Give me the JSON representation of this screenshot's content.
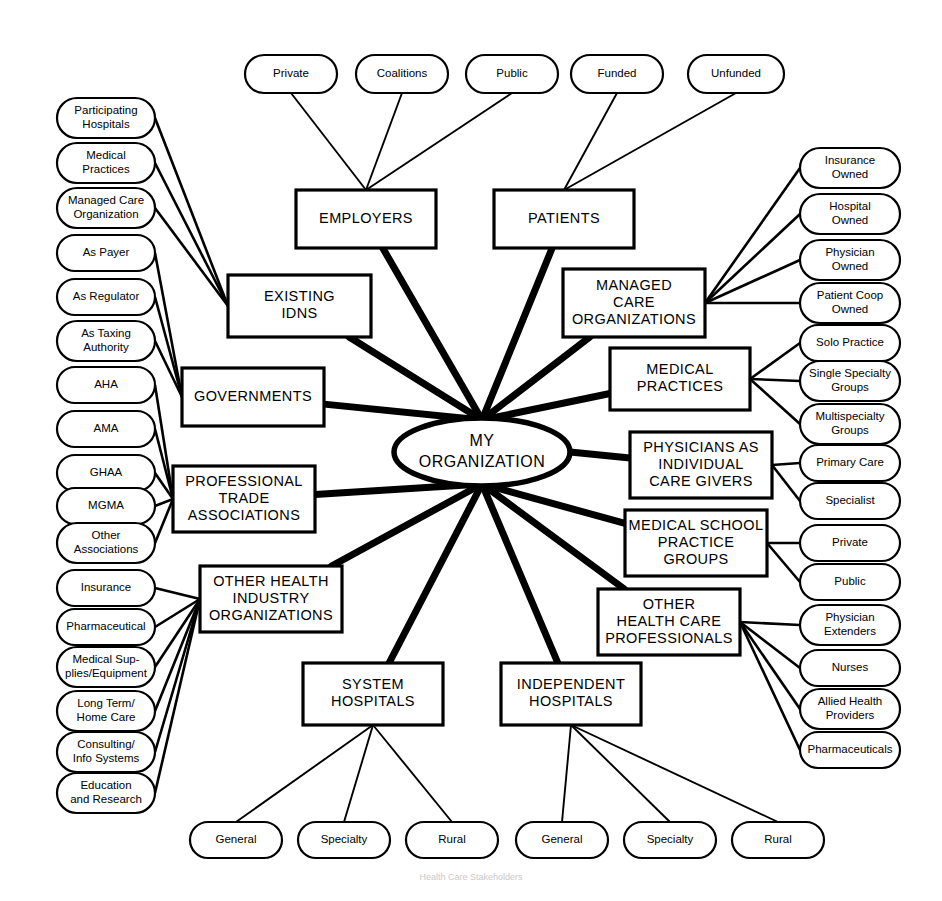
{
  "diagram": {
    "center": {
      "line1": "MY",
      "line2": "ORGANIZATION"
    },
    "colors": {
      "stroke": "#000000",
      "fill": "#ffffff",
      "background": "#ffffff"
    },
    "caption": "Health Care Stakeholders"
  },
  "top_pills": [
    {
      "label": "Private",
      "x": 245,
      "y": 74,
      "w": 92,
      "h": 38
    },
    {
      "label": "Coalitions",
      "x": 356,
      "y": 74,
      "w": 92,
      "h": 38
    },
    {
      "label": "Public",
      "x": 466,
      "y": 74,
      "w": 92,
      "h": 38
    },
    {
      "label": "Funded",
      "x": 571,
      "y": 74,
      "w": 92,
      "h": 38
    },
    {
      "label": "Unfunded",
      "x": 688,
      "y": 74,
      "w": 96,
      "h": 38
    }
  ],
  "left_pills": [
    {
      "lines": [
        "Participating",
        "Hospitals"
      ],
      "cy": 118,
      "target": "existing-idns"
    },
    {
      "lines": [
        "Medical",
        "Practices"
      ],
      "cy": 163,
      "target": "existing-idns"
    },
    {
      "lines": [
        "Managed Care",
        "Organization"
      ],
      "cy": 208,
      "target": "existing-idns"
    },
    {
      "lines": [
        "As Payer"
      ],
      "cy": 253,
      "target": "governments"
    },
    {
      "lines": [
        "As Regulator"
      ],
      "cy": 297,
      "target": "governments"
    },
    {
      "lines": [
        "As Taxing",
        "Authority"
      ],
      "cy": 341,
      "target": "governments"
    },
    {
      "lines": [
        "AHA"
      ],
      "cy": 385,
      "target": "professional-trade"
    },
    {
      "lines": [
        "AMA"
      ],
      "cy": 429,
      "target": "professional-trade"
    },
    {
      "lines": [
        "GHAA"
      ],
      "cy": 473,
      "target": "professional-trade"
    },
    {
      "lines": [
        "MGMA"
      ],
      "cy": 506,
      "target": "professional-trade"
    },
    {
      "lines": [
        "Other",
        "Associations"
      ],
      "cy": 543,
      "target": "professional-trade"
    },
    {
      "lines": [
        "Insurance"
      ],
      "cy": 588,
      "target": "other-health-industry"
    },
    {
      "lines": [
        "Pharmaceutical"
      ],
      "cy": 627,
      "target": "other-health-industry"
    },
    {
      "lines": [
        "Medical Sup-",
        "plies/Equipment"
      ],
      "cy": 667,
      "target": "other-health-industry"
    },
    {
      "lines": [
        "Long Term/",
        "Home Care"
      ],
      "cy": 711,
      "target": "other-health-industry"
    },
    {
      "lines": [
        "Consulting/",
        "Info Systems"
      ],
      "cy": 752,
      "target": "other-health-industry"
    },
    {
      "lines": [
        "Education",
        "and Research"
      ],
      "cy": 793,
      "target": "other-health-industry"
    }
  ],
  "right_pills": [
    {
      "lines": [
        "Insurance",
        "Owned"
      ],
      "cy": 168,
      "target": "managed-care"
    },
    {
      "lines": [
        "Hospital",
        "Owned"
      ],
      "cy": 214,
      "target": "managed-care"
    },
    {
      "lines": [
        "Physician",
        "Owned"
      ],
      "cy": 260,
      "target": "managed-care"
    },
    {
      "lines": [
        "Patient Coop",
        "Owned"
      ],
      "cy": 303,
      "target": "managed-care"
    },
    {
      "lines": [
        "Solo Practice"
      ],
      "cy": 343,
      "target": "medical-practices"
    },
    {
      "lines": [
        "Single Specialty",
        "Groups"
      ],
      "cy": 381,
      "target": "medical-practices"
    },
    {
      "lines": [
        "Multispecialty",
        "Groups"
      ],
      "cy": 424,
      "target": "medical-practices"
    },
    {
      "lines": [
        "Primary Care"
      ],
      "cy": 463,
      "target": "physicians-individual"
    },
    {
      "lines": [
        "Specialist"
      ],
      "cy": 501,
      "target": "physicians-individual"
    },
    {
      "lines": [
        "Private"
      ],
      "cy": 543,
      "target": "medical-school"
    },
    {
      "lines": [
        "Public"
      ],
      "cy": 582,
      "target": "medical-school"
    },
    {
      "lines": [
        "Physician",
        "Extenders"
      ],
      "cy": 625,
      "target": "other-health-care-prof"
    },
    {
      "lines": [
        "Nurses"
      ],
      "cy": 668,
      "target": "other-health-care-prof"
    },
    {
      "lines": [
        "Allied Health",
        "Providers"
      ],
      "cy": 709,
      "target": "other-health-care-prof"
    },
    {
      "lines": [
        "Pharmaceuticals"
      ],
      "cy": 750,
      "target": "other-health-care-prof"
    }
  ],
  "bottom_pills": [
    {
      "label": "General",
      "x": 190,
      "y": 840,
      "w": 92,
      "h": 36,
      "target": "system-hospitals"
    },
    {
      "label": "Specialty",
      "x": 298,
      "y": 840,
      "w": 92,
      "h": 36,
      "target": "system-hospitals"
    },
    {
      "label": "Rural",
      "x": 406,
      "y": 840,
      "w": 92,
      "h": 36,
      "target": "system-hospitals"
    },
    {
      "label": "General",
      "x": 516,
      "y": 840,
      "w": 92,
      "h": 36,
      "target": "independent-hospitals"
    },
    {
      "label": "Specialty",
      "x": 624,
      "y": 840,
      "w": 92,
      "h": 36,
      "target": "independent-hospitals"
    },
    {
      "label": "Rural",
      "x": 732,
      "y": 840,
      "w": 92,
      "h": 36,
      "target": "independent-hospitals"
    }
  ],
  "boxes": [
    {
      "id": "employers",
      "lines": [
        "EMPLOYERS"
      ],
      "x": 296,
      "y": 190,
      "w": 140,
      "h": 58
    },
    {
      "id": "patients",
      "lines": [
        "PATIENTS"
      ],
      "x": 494,
      "y": 190,
      "w": 140,
      "h": 58
    },
    {
      "id": "existing-idns",
      "lines": [
        "EXISTING",
        "IDNS"
      ],
      "x": 228,
      "y": 275,
      "w": 143,
      "h": 62
    },
    {
      "id": "managed-care",
      "lines": [
        "MANAGED",
        "CARE",
        "ORGANIZATIONS"
      ],
      "x": 563,
      "y": 269,
      "w": 142,
      "h": 68
    },
    {
      "id": "governments",
      "lines": [
        "GOVERNMENTS"
      ],
      "x": 182,
      "y": 368,
      "w": 142,
      "h": 58
    },
    {
      "id": "medical-practices",
      "lines": [
        "MEDICAL",
        "PRACTICES"
      ],
      "x": 610,
      "y": 348,
      "w": 140,
      "h": 62
    },
    {
      "id": "professional-trade",
      "lines": [
        "PROFESSIONAL",
        "TRADE",
        "ASSOCIATIONS"
      ],
      "x": 173,
      "y": 466,
      "w": 142,
      "h": 66
    },
    {
      "id": "physicians-individual",
      "lines": [
        "PHYSICIANS AS",
        "INDIVIDUAL",
        "CARE GIVERS"
      ],
      "x": 630,
      "y": 432,
      "w": 142,
      "h": 66
    },
    {
      "id": "medical-school",
      "lines": [
        "MEDICAL SCHOOL",
        "PRACTICE",
        "GROUPS"
      ],
      "x": 625,
      "y": 510,
      "w": 142,
      "h": 66
    },
    {
      "id": "other-health-industry",
      "lines": [
        "OTHER HEALTH",
        "INDUSTRY",
        "ORGANIZATIONS"
      ],
      "x": 200,
      "y": 566,
      "w": 142,
      "h": 66
    },
    {
      "id": "other-health-care-prof",
      "lines": [
        "OTHER",
        "HEALTH CARE",
        "PROFESSIONALS"
      ],
      "x": 598,
      "y": 589,
      "w": 142,
      "h": 66
    },
    {
      "id": "system-hospitals",
      "lines": [
        "SYSTEM",
        "HOSPITALS"
      ],
      "x": 303,
      "y": 663,
      "w": 140,
      "h": 62
    },
    {
      "id": "independent-hospitals",
      "lines": [
        "INDEPENDENT",
        "HOSPITALS"
      ],
      "x": 501,
      "y": 663,
      "w": 140,
      "h": 62
    }
  ],
  "hub_links": [
    {
      "from": "employers",
      "label": "employers-to-hub"
    },
    {
      "from": "patients",
      "label": "patients-to-hub"
    },
    {
      "from": "existing-idns",
      "label": "existing-idns-to-hub"
    },
    {
      "from": "managed-care",
      "label": "managed-care-to-hub"
    },
    {
      "from": "governments",
      "label": "governments-to-hub"
    },
    {
      "from": "medical-practices",
      "label": "medical-practices-to-hub"
    },
    {
      "from": "professional-trade",
      "label": "professional-trade-to-hub"
    },
    {
      "from": "physicians-individual",
      "label": "physicians-individual-to-hub"
    },
    {
      "from": "medical-school",
      "label": "medical-school-to-hub"
    },
    {
      "from": "other-health-industry",
      "label": "other-health-industry-to-hub"
    },
    {
      "from": "other-health-care-prof",
      "label": "other-health-care-prof-to-hub"
    },
    {
      "from": "system-hospitals",
      "label": "system-hospitals-to-hub"
    },
    {
      "from": "independent-hospitals",
      "label": "independent-hospitals-to-hub"
    }
  ]
}
